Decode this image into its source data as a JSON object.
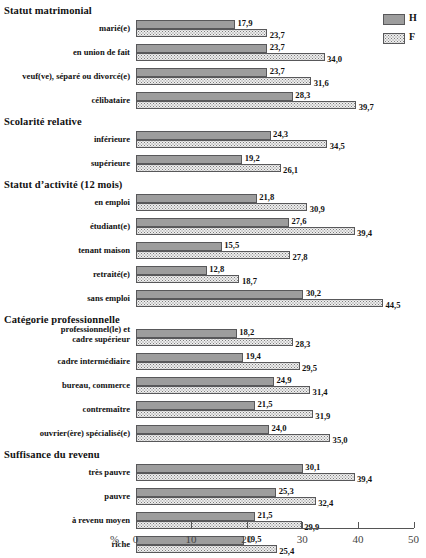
{
  "chart_data": {
    "type": "bar",
    "orientation": "horizontal",
    "title": "",
    "xlabel": "%",
    "ylabel": "",
    "xlim": [
      0,
      50
    ],
    "xticks": [
      0,
      10,
      20,
      30,
      40,
      50
    ],
    "grid": false,
    "legend_position": "top-right",
    "legend": [
      {
        "name": "H",
        "style": "solid-gray"
      },
      {
        "name": "F",
        "style": "dotted-light"
      }
    ],
    "series": [
      {
        "name": "H"
      },
      {
        "name": "F"
      }
    ],
    "groups": [
      {
        "title": "Statut matrimonial",
        "categories": [
          {
            "label": "marié(e)",
            "H": 17.9,
            "F": 23.7,
            "H_text": "17,9",
            "F_text": "23,7"
          },
          {
            "label": "en union de fait",
            "H": 23.7,
            "F": 34.0,
            "H_text": "23,7",
            "F_text": "34,0"
          },
          {
            "label": "veuf(ve), séparé ou divorcé(e)",
            "H": 23.7,
            "F": 31.6,
            "H_text": "23,7",
            "F_text": "31,6"
          },
          {
            "label": "célibataire",
            "H": 28.3,
            "F": 39.7,
            "H_text": "28,3",
            "F_text": "39,7"
          }
        ]
      },
      {
        "title": "Scolarité relative",
        "categories": [
          {
            "label": "inférieure",
            "H": 24.3,
            "F": 34.5,
            "H_text": "24,3",
            "F_text": "34,5"
          },
          {
            "label": "supérieure",
            "H": 19.2,
            "F": 26.1,
            "H_text": "19,2",
            "F_text": "26,1"
          }
        ]
      },
      {
        "title": "Statut d’activité (12 mois)",
        "categories": [
          {
            "label": "en emploi",
            "H": 21.8,
            "F": 30.9,
            "H_text": "21,8",
            "F_text": "30,9"
          },
          {
            "label": "étudiant(e)",
            "H": 27.6,
            "F": 39.4,
            "H_text": "27,6",
            "F_text": "39,4"
          },
          {
            "label": "tenant maison",
            "H": 15.5,
            "F": 27.8,
            "H_text": "15,5",
            "F_text": "27,8"
          },
          {
            "label": "retraité(e)",
            "H": 12.8,
            "F": 18.7,
            "H_text": "12,8",
            "F_text": "18,7"
          },
          {
            "label": "sans emploi",
            "H": 30.2,
            "F": 44.5,
            "H_text": "30,2",
            "F_text": "44,5"
          }
        ]
      },
      {
        "title": "Catégorie professionnelle",
        "categories": [
          {
            "label": "professionnel(le) et\ncadre supérieur",
            "H": 18.2,
            "F": 28.3,
            "H_text": "18,2",
            "F_text": "28,3"
          },
          {
            "label": "cadre intermédiaire",
            "H": 19.4,
            "F": 29.5,
            "H_text": "19,4",
            "F_text": "29,5"
          },
          {
            "label": "bureau, commerce",
            "H": 24.9,
            "F": 31.4,
            "H_text": "24,9",
            "F_text": "31,4"
          },
          {
            "label": "contremaître",
            "H": 21.5,
            "F": 31.9,
            "H_text": "21,5",
            "F_text": "31,9"
          },
          {
            "label": "ouvrier(ère) spécialisé(e)",
            "H": 24.0,
            "F": 35.0,
            "H_text": "24,0",
            "F_text": "35,0"
          }
        ]
      },
      {
        "title": "Suffisance du revenu",
        "categories": [
          {
            "label": "très pauvre",
            "H": 30.1,
            "F": 39.4,
            "H_text": "30,1",
            "F_text": "39,4"
          },
          {
            "label": "pauvre",
            "H": 25.3,
            "F": 32.4,
            "H_text": "25,3",
            "F_text": "32,4"
          },
          {
            "label": "à revenu moyen",
            "H": 21.5,
            "F": 29.9,
            "H_text": "21,5",
            "F_text": "29,9"
          },
          {
            "label": "riche",
            "H": 19.5,
            "F": 25.4,
            "H_text": "19,5",
            "F_text": "25,4"
          }
        ]
      }
    ],
    "colors": {
      "bar_h": "#9d9d9d",
      "bar_f": "#ededed",
      "bar_border": "#58585a",
      "text": "#111111",
      "axis": "#555555"
    }
  }
}
